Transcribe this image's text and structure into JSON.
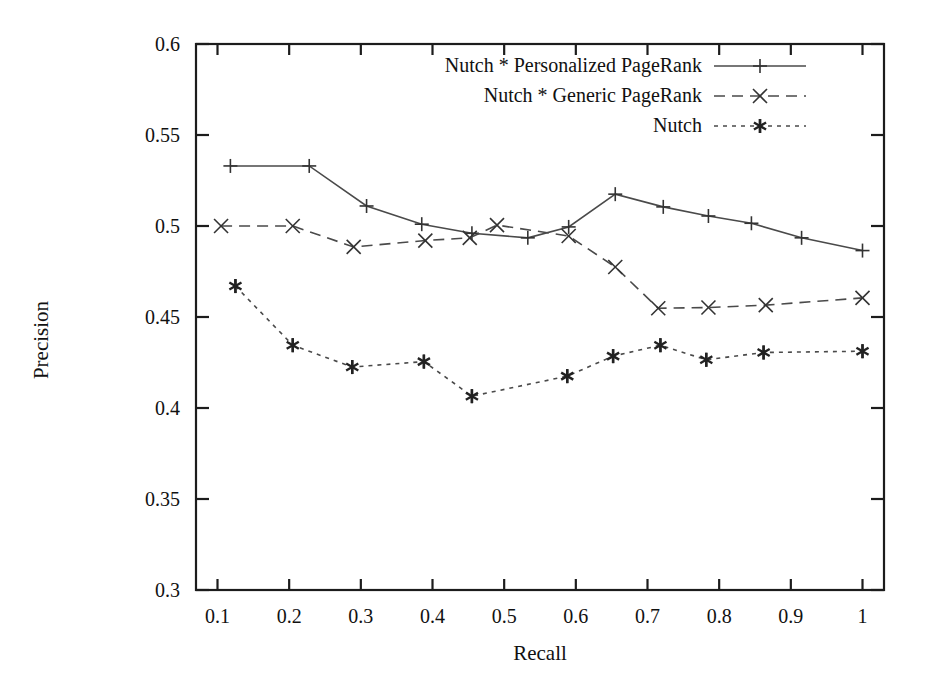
{
  "chart_data": {
    "type": "line",
    "title": "",
    "xlabel": "Recall",
    "ylabel": "Precision",
    "xlim": [
      0.07,
      1.03
    ],
    "ylim": [
      0.3,
      0.6
    ],
    "xticks": [
      "0.1",
      "0.2",
      "0.3",
      "0.4",
      "0.5",
      "0.6",
      "0.7",
      "0.8",
      "0.9",
      "1"
    ],
    "xtick_values": [
      0.1,
      0.2,
      0.3,
      0.4,
      0.5,
      0.6,
      0.7,
      0.8,
      0.9,
      1.0
    ],
    "yticks": [
      "0.3",
      "0.35",
      "0.4",
      "0.45",
      "0.5",
      "0.55",
      "0.6"
    ],
    "ytick_values": [
      0.3,
      0.35,
      0.4,
      0.45,
      0.5,
      0.55,
      0.6
    ],
    "grid": false,
    "legend_position": "top-right-inside",
    "series": [
      {
        "name": "Nutch * Personalized PageRank",
        "marker": "plus",
        "dash": "solid",
        "x": [
          0.118,
          0.228,
          0.308,
          0.385,
          0.455,
          0.533,
          0.59,
          0.655,
          0.722,
          0.785,
          0.845,
          0.915,
          1.0
        ],
        "y": [
          0.533,
          0.533,
          0.511,
          0.501,
          0.496,
          0.4935,
          0.4995,
          0.5175,
          0.5105,
          0.5055,
          0.5015,
          0.4935,
          0.4865
        ]
      },
      {
        "name": "Nutch * Generic PageRank",
        "marker": "cross",
        "dash": "dashed",
        "x": [
          0.105,
          0.205,
          0.29,
          0.39,
          0.452,
          0.49,
          0.59,
          0.655,
          0.715,
          0.785,
          0.865,
          1.0
        ],
        "y": [
          0.5,
          0.5,
          0.4885,
          0.492,
          0.4935,
          0.5005,
          0.4945,
          0.4775,
          0.4548,
          0.4552,
          0.4565,
          0.4605
        ]
      },
      {
        "name": "Nutch",
        "marker": "star",
        "dash": "dotted",
        "x": [
          0.125,
          0.205,
          0.288,
          0.388,
          0.455,
          0.588,
          0.652,
          0.718,
          0.782,
          0.862,
          1.0
        ],
        "y": [
          0.467,
          0.4345,
          0.4225,
          0.4255,
          0.4065,
          0.4175,
          0.4285,
          0.4345,
          0.4265,
          0.4305,
          0.4312
        ]
      }
    ]
  },
  "legend": {
    "items": [
      {
        "label": "Nutch * Personalized PageRank",
        "marker": "plus",
        "dash": "solid"
      },
      {
        "label": "Nutch * Generic PageRank",
        "marker": "cross",
        "dash": "dashed"
      },
      {
        "label": "Nutch",
        "marker": "star",
        "dash": "dotted"
      }
    ]
  }
}
